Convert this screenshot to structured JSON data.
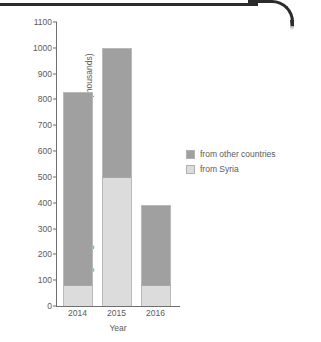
{
  "chart_data": {
    "type": "bar",
    "subtype": "stacked",
    "title": "",
    "subtitle": "",
    "xlabel": "Year",
    "ylabel": "Illegal migrants to the EU from non-EU countries (thousands)",
    "categories": [
      "2014",
      "2015",
      "2016"
    ],
    "series": [
      {
        "name": "from Syria",
        "values": [
          80,
          500,
          80
        ],
        "color": "#dcdcdc"
      },
      {
        "name": "from other countries",
        "values": [
          750,
          500,
          310
        ],
        "color": "#a0a0a0"
      }
    ],
    "stack_order_bottom_to_top": [
      "from Syria",
      "from other countries"
    ],
    "totals": [
      830,
      1000,
      390
    ],
    "ylim": [
      0,
      1100
    ],
    "ytick_step": 100,
    "ytick_labels": [
      "0",
      "100",
      "200",
      "300",
      "400",
      "500",
      "600",
      "700",
      "800",
      "900",
      "1000",
      "1100"
    ],
    "grid": false,
    "legend_position": "right",
    "legend_entries": [
      "from other countries",
      "from Syria"
    ]
  },
  "legend": {
    "rows": [
      {
        "label": "from other countries"
      },
      {
        "label": "from Syria"
      }
    ]
  },
  "artifacts": {
    "scan_edge_color": "#2b2b2b",
    "note": "dark scanned page edge along top, curving at top-right"
  }
}
